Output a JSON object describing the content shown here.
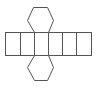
{
  "diagram": {
    "type": "net",
    "shape": "hexagonal-prism-net",
    "stroke_color": "#555555",
    "fill_color": "#ffffff",
    "background": "#ffffff",
    "rectangles": [
      {
        "x": 5,
        "y": 32,
        "w": 15,
        "h": 23
      },
      {
        "x": 20,
        "y": 32,
        "w": 14,
        "h": 23
      },
      {
        "x": 34,
        "y": 32,
        "w": 14,
        "h": 23
      },
      {
        "x": 48,
        "y": 32,
        "w": 14,
        "h": 23
      },
      {
        "x": 62,
        "y": 32,
        "w": 14,
        "h": 23
      },
      {
        "x": 76,
        "y": 32,
        "w": 15,
        "h": 23
      }
    ],
    "hexagons": [
      {
        "position": "top",
        "points": "34,32 27,20 33,7 47,7 53,20 48,32"
      },
      {
        "position": "bottom",
        "points": "34,55 27,67 34,80 47,80 53,67 48,55"
      }
    ]
  }
}
